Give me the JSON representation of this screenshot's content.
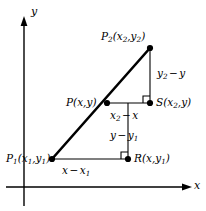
{
  "figure": {
    "axes": {
      "x_label": "x",
      "y_label": "y"
    },
    "points": [
      {
        "id": "P2",
        "name": "point-p2",
        "base": "P",
        "base_sub": "2",
        "coord_open": "(",
        "coord_x": "x",
        "coord_x_sub": "2",
        "coord_comma": ",",
        "coord_y": "y",
        "coord_y_sub": "2",
        "coord_close": ")",
        "full_text": "P2(x2,y2)"
      },
      {
        "id": "P",
        "name": "point-p",
        "base": "P",
        "base_sub": "",
        "coord_open": "(",
        "coord_x": "x",
        "coord_x_sub": "",
        "coord_comma": ",",
        "coord_y": "y",
        "coord_y_sub": "",
        "coord_close": ")",
        "full_text": "P(x,y)"
      },
      {
        "id": "S",
        "name": "point-s",
        "base": "S",
        "base_sub": "",
        "coord_open": "(",
        "coord_x": "x",
        "coord_x_sub": "2",
        "coord_comma": ",",
        "coord_y": "y",
        "coord_y_sub": "",
        "coord_close": ")",
        "full_text": "S(x2,y)"
      },
      {
        "id": "P1",
        "name": "point-p1",
        "base": "P",
        "base_sub": "1",
        "coord_open": "(",
        "coord_x": "x",
        "coord_x_sub": "1",
        "coord_comma": ",",
        "coord_y": "y",
        "coord_y_sub": "1",
        "coord_close": ")",
        "full_text": "P1(x1,y1)"
      },
      {
        "id": "R",
        "name": "point-r",
        "base": "R",
        "base_sub": "",
        "coord_open": "(",
        "coord_x": "x",
        "coord_x_sub": "",
        "coord_comma": ",",
        "coord_y": "y",
        "coord_y_sub": "1",
        "coord_close": ")",
        "full_text": "R(x,y1)"
      }
    ],
    "segments": [
      {
        "id": "y2_minus_y",
        "name": "segment-label-vertical-upper",
        "term1": "y",
        "term1_sub": "2",
        "operator": "−",
        "term2": "y",
        "term2_sub": "",
        "full_text": "y2 − y"
      },
      {
        "id": "x2_minus_x",
        "name": "segment-label-horizontal-upper",
        "term1": "x",
        "term1_sub": "2",
        "operator": "−",
        "term2": "x",
        "term2_sub": "",
        "full_text": "x2 − x"
      },
      {
        "id": "y_minus_y1",
        "name": "segment-label-vertical-lower",
        "term1": "y",
        "term1_sub": "",
        "operator": "−",
        "term2": "y",
        "term2_sub": "1",
        "full_text": "y − y1"
      },
      {
        "id": "x_minus_x1",
        "name": "segment-label-horizontal-lower",
        "term1": "x",
        "term1_sub": "",
        "operator": "−",
        "term2": "x",
        "term2_sub": "1",
        "full_text": "x − x1"
      }
    ],
    "colors": {
      "stroke": "#000000",
      "background": "#ffffff"
    }
  }
}
